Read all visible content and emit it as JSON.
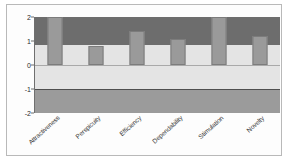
{
  "chart_data": {
    "type": "bar",
    "title": "",
    "subtitle": "",
    "xlabel": "",
    "ylabel": "",
    "categories": [
      "Attractiveness",
      "Perspicuity",
      "Efficiency",
      "Dependability",
      "Stimulation",
      "Novelty"
    ],
    "values": [
      2.0,
      0.8,
      1.4,
      1.1,
      2.0,
      1.2
    ],
    "series": [
      {
        "name": "Scale mean",
        "values": [
          2.0,
          0.8,
          1.4,
          1.1,
          2.0,
          1.2
        ]
      }
    ],
    "ylim": [
      -2,
      2
    ],
    "yticks": [
      2,
      1,
      0,
      -1,
      -2
    ],
    "ytick_labels": [
      "2",
      "1",
      "0",
      "-1",
      "-2"
    ],
    "grid": true,
    "gridlines": [
      0,
      -1
    ],
    "legend": "none",
    "legend_position": "none",
    "background_bands": [
      {
        "name": "upper-band",
        "from": 0.8,
        "to": 2,
        "color": "#6d6d6d"
      },
      {
        "name": "middle-band",
        "from": -1,
        "to": 0.8,
        "color": "#e4e4e4"
      },
      {
        "name": "lower-band",
        "from": -2,
        "to": -1,
        "color": "#9b9b9b"
      }
    ],
    "bar_color": "#9a9a9a",
    "bar_edge_color": "#7c7c7c",
    "axis_color": "#6f6f6f"
  }
}
